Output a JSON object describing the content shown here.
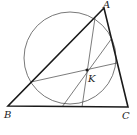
{
  "diagram": {
    "type": "geometry",
    "colors": {
      "stroke": "#1a1a1a",
      "thin": "#444444",
      "background": "#ffffff"
    },
    "points": {
      "A": {
        "label": "A",
        "x": 104,
        "y": 8
      },
      "B": {
        "label": "B",
        "x": 8,
        "y": 106
      },
      "C": {
        "label": "C",
        "x": 128,
        "y": 107
      },
      "K": {
        "label": "K",
        "x": 87,
        "y": 70
      }
    },
    "circle": {
      "cx": 70,
      "cy": 58,
      "r": 46
    },
    "chords": [
      {
        "from": [
          31,
          82
        ],
        "to": [
          117,
          63
        ]
      },
      {
        "from": [
          95,
          18
        ],
        "to": [
          82,
          107
        ]
      },
      {
        "from": [
          112,
          38
        ],
        "to": [
          62,
          107
        ]
      }
    ]
  }
}
